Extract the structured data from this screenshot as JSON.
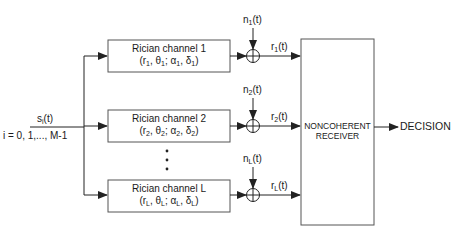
{
  "input": {
    "signal": "s",
    "signal_sub": "i",
    "signal_arg": "(t)",
    "index_range": "i = 0, 1,..., M-1"
  },
  "channels": [
    {
      "title": "Rician channel 1",
      "sub": "1",
      "noise": "n",
      "noise_sub": "1",
      "noise_arg": "(t)",
      "output": "r",
      "output_sub": "1",
      "output_arg": "(t)"
    },
    {
      "title": "Rician channel 2",
      "sub": "2",
      "noise": "n",
      "noise_sub": "2",
      "noise_arg": "(t)",
      "output": "r",
      "output_sub": "2",
      "output_arg": "(t)"
    },
    {
      "title": "Rician channel L",
      "sub": "L",
      "noise": "n",
      "noise_sub": "L",
      "noise_arg": "(t)",
      "output": "r",
      "output_sub": "L",
      "output_arg": "(t)"
    }
  ],
  "param_symbols": [
    "r",
    "θ",
    "α",
    "δ"
  ],
  "ellipsis": "•",
  "receiver": {
    "line1": "NONCOHERENT",
    "line2": "RECEIVER"
  },
  "output_label": "DECISION",
  "colors": {
    "line": "#222222",
    "box_border": "#555555",
    "text": "#1a1a1a"
  }
}
